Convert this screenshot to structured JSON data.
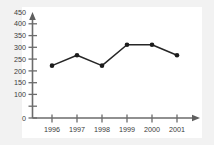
{
  "figure": {
    "background_color": "#f2f2f2",
    "plot_background_color": "#ffffff",
    "axis_color": "#6b6b6b",
    "line_color": "#262626",
    "marker_color": "#1c1c1c",
    "label_color": "#3a3a3a"
  },
  "chart_data": {
    "type": "line",
    "title": "",
    "subtitle": "",
    "xlabel": "",
    "ylabel": "",
    "categories": [
      "1996",
      "1997",
      "1998",
      "1999",
      "2000",
      "2001"
    ],
    "values": [
      250,
      300,
      250,
      350,
      350,
      300
    ],
    "series": [
      {
        "name": "",
        "values": [
          250,
          300,
          250,
          350,
          350,
          300
        ]
      }
    ],
    "ylim": [
      0,
      475
    ],
    "xlim": [
      1995.4,
      2001.9
    ],
    "y_tick_values": [
      0,
      50,
      100,
      150,
      200,
      250,
      300,
      350,
      400,
      450
    ],
    "y_tick_labels": [
      "0",
      "",
      "100",
      "150",
      "200",
      "250",
      "300",
      "350",
      "400",
      "450"
    ],
    "x_tick_labels": [
      "1996",
      "1997",
      "1998",
      "1999",
      "2000",
      "2001"
    ],
    "grid": false,
    "legend": false,
    "legend_position": "none",
    "markers": "filled-circle",
    "axis_style": "arrow-terminated",
    "annotations": []
  }
}
